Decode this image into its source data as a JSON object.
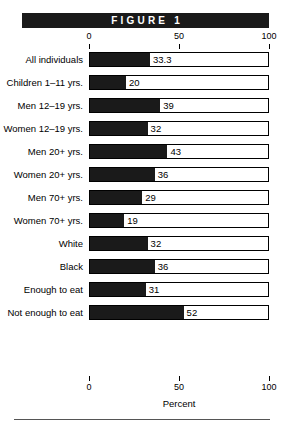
{
  "figure": {
    "banner_label": "FIGURE 1"
  },
  "chart_data": {
    "type": "bar",
    "orientation": "horizontal",
    "title": "FIGURE 1",
    "xlabel": "Percent",
    "ylabel": "",
    "xlim": [
      0,
      100
    ],
    "xticks": [
      0,
      50,
      100
    ],
    "xtick_labels": [
      "0",
      "50",
      "100"
    ],
    "grid": false,
    "legend": "none",
    "axis_top": true,
    "axis_bottom": true,
    "categories": [
      "All individuals",
      "Children 1–11 yrs.",
      "Men 12–19 yrs.",
      "Women 12–19 yrs.",
      "Men 20+ yrs.",
      "Women 20+ yrs.",
      "Men 70+ yrs.",
      "Women 70+ yrs.",
      "White",
      "Black",
      "Enough to eat",
      "Not enough to eat"
    ],
    "values": [
      33.3,
      20,
      39,
      32,
      43,
      36,
      29,
      19,
      32,
      36,
      31,
      52
    ],
    "value_labels": [
      "33.3",
      "20",
      "39",
      "32",
      "43",
      "36",
      "29",
      "19",
      "32",
      "36",
      "31",
      "52"
    ],
    "bar_color": "#1a1a1a",
    "track_color": "#ffffff",
    "outline_color": "#000000"
  }
}
